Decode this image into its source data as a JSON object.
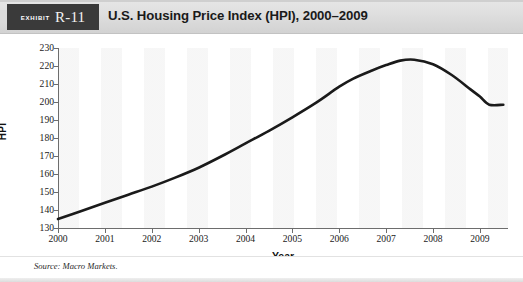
{
  "exhibit": {
    "badge_word": "Exhibit",
    "badge_number": "R-11",
    "title": "U.S. Housing Price Index (HPI), 2000–2009"
  },
  "source": {
    "note": "Source: Macro Markets."
  },
  "axes": {
    "y_title": "HPI",
    "x_title": "Year"
  },
  "colors": {
    "header_band": "#dedede",
    "badge_background": "#3a3a3a",
    "line": "#1a1a1a",
    "axis": "#6d6d6d",
    "plot_band": "#f5f5f5"
  },
  "chart_data": {
    "type": "line",
    "title": "U.S. Housing Price Index (HPI), 2000–2009",
    "xlabel": "Year",
    "ylabel": "HPI",
    "xlim": [
      2000,
      2009.6
    ],
    "ylim": [
      130,
      230
    ],
    "ytick_labels": [
      "230",
      "220",
      "210",
      "200",
      "190",
      "180",
      "170",
      "160",
      "150",
      "140",
      "130"
    ],
    "yticks": [
      230,
      220,
      210,
      200,
      190,
      180,
      170,
      160,
      150,
      140,
      130
    ],
    "xtick_labels": [
      "2000",
      "2001",
      "2002",
      "2003",
      "2004",
      "2005",
      "2006",
      "2007",
      "2008",
      "2009"
    ],
    "xticks": [
      2000,
      2001,
      2002,
      2003,
      2004,
      2005,
      2006,
      2007,
      2008,
      2009
    ],
    "grid": false,
    "legend": false,
    "series": [
      {
        "name": "HPI",
        "color": "#1a1a1a",
        "x": [
          2000.0,
          2000.5,
          2001.0,
          2001.5,
          2002.0,
          2002.5,
          2003.0,
          2003.5,
          2004.0,
          2004.5,
          2005.0,
          2005.5,
          2006.0,
          2006.3,
          2006.7,
          2007.0,
          2007.3,
          2007.6,
          2008.0,
          2008.4,
          2008.8,
          2009.0,
          2009.2,
          2009.5
        ],
        "y": [
          135.0,
          139.5,
          144.0,
          148.5,
          153.0,
          158.0,
          163.5,
          170.0,
          177.0,
          184.0,
          191.5,
          199.5,
          208.5,
          213.0,
          217.5,
          220.5,
          223.0,
          223.5,
          221.0,
          215.0,
          207.0,
          203.0,
          198.5,
          198.5
        ]
      }
    ],
    "annotations": [
      {
        "text": "Peak ~223 in 2007",
        "visible": false
      }
    ]
  }
}
